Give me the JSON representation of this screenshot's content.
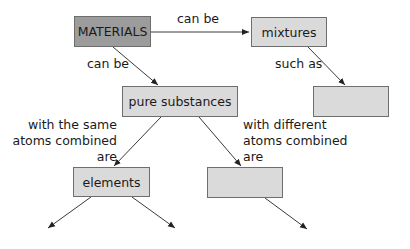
{
  "diagram": {
    "type": "concept-map",
    "colors": {
      "root_fill": "#9c9c9c",
      "node_fill": "#dadada",
      "border": "#6e6e6e",
      "line": "#333333"
    },
    "nodes": {
      "materials": {
        "text": "MATERIALS"
      },
      "mixtures": {
        "text": "mixtures"
      },
      "mixtures_example": {
        "text": ""
      },
      "pure_substances": {
        "text": "pure substances"
      },
      "elements": {
        "text": "elements"
      },
      "compounds": {
        "text": ""
      }
    },
    "links": {
      "materials_to_mixtures": {
        "text": "can be"
      },
      "materials_to_pure": {
        "text": "can be"
      },
      "mixtures_to_example": {
        "text": "such as"
      },
      "pure_to_elements": {
        "lines": [
          "with the same",
          "atoms combined",
          "are"
        ]
      },
      "pure_to_compounds": {
        "lines": [
          "with different",
          "atoms combined",
          "are"
        ]
      }
    }
  }
}
